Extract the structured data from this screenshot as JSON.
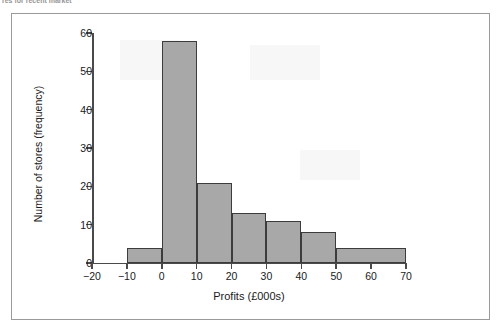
{
  "top_caption": "res for recent market",
  "figure": {
    "frame_color": "#9a9a9a",
    "background": "#ffffff"
  },
  "chart_data": {
    "type": "bar",
    "title": "",
    "subtitle": "",
    "xlabel": "Profits (£000s)",
    "ylabel": "Number of stores (frequency)",
    "xlim": [
      -20,
      70
    ],
    "ylim": [
      0,
      60
    ],
    "xticks": [
      -20,
      -10,
      0,
      10,
      20,
      30,
      40,
      50,
      60,
      70
    ],
    "xtick_labels": [
      "−20",
      "−10",
      "0",
      "10",
      "20",
      "30",
      "40",
      "50",
      "60",
      "70"
    ],
    "yticks": [
      0,
      10,
      20,
      30,
      40,
      50,
      60
    ],
    "ytick_labels": [
      "0",
      "10",
      "20",
      "30",
      "40",
      "50",
      "60"
    ],
    "grid": false,
    "legend": null,
    "bar_fill_color": "#a8a8a8",
    "bar_edge_color": "#3c3c3c",
    "categories": [
      "-10 to 0",
      "0 to 10",
      "10 to 20",
      "20 to 30",
      "30 to 40",
      "40 to 50",
      "50 to 70"
    ],
    "bins": [
      {
        "label": "-10 to 0",
        "x0": -10,
        "x1": 0,
        "value": 4
      },
      {
        "label": "0 to 10",
        "x0": 0,
        "x1": 10,
        "value": 58
      },
      {
        "label": "10 to 20",
        "x0": 10,
        "x1": 20,
        "value": 21
      },
      {
        "label": "20 to 30",
        "x0": 20,
        "x1": 30,
        "value": 13
      },
      {
        "label": "30 to 40",
        "x0": 30,
        "x1": 40,
        "value": 11
      },
      {
        "label": "40 to 50",
        "x0": 40,
        "x1": 50,
        "value": 8
      },
      {
        "label": "50 to 70",
        "x0": 50,
        "x1": 70,
        "value": 4
      }
    ],
    "values": [
      4,
      58,
      21,
      13,
      11,
      8,
      4
    ]
  }
}
